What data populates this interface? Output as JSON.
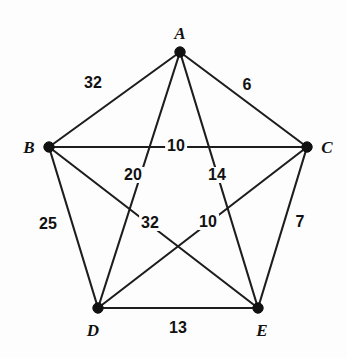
{
  "figure": {
    "background_color": "#fdfdfd",
    "line_color": "#1d1d1d",
    "text_color": "#111111"
  },
  "chart_data": {
    "type": "diagram",
    "subtype": "weighted-complete-graph",
    "title": "",
    "node_count": 5,
    "edge_count": 10,
    "nodes": [
      {
        "id": "A",
        "label": "A",
        "x": 180,
        "y": 52,
        "label_x": 180,
        "label_y": 33
      },
      {
        "id": "B",
        "label": "B",
        "x": 49,
        "y": 147,
        "label_x": 29,
        "label_y": 147
      },
      {
        "id": "C",
        "label": "C",
        "x": 307,
        "y": 147,
        "label_x": 327,
        "label_y": 147
      },
      {
        "id": "D",
        "label": "D",
        "x": 98,
        "y": 308,
        "label_x": 93,
        "label_y": 330
      },
      {
        "id": "E",
        "label": "E",
        "x": 258,
        "y": 308,
        "label_x": 262,
        "label_y": 330
      }
    ],
    "edges": [
      {
        "from": "A",
        "to": "B",
        "weight": "32",
        "label_x": 93,
        "label_y": 83
      },
      {
        "from": "A",
        "to": "C",
        "weight": "6",
        "label_x": 247,
        "label_y": 85
      },
      {
        "from": "A",
        "to": "D",
        "weight": "20",
        "label_x": 133,
        "label_y": 175
      },
      {
        "from": "A",
        "to": "E",
        "weight": "14",
        "label_x": 217,
        "label_y": 175
      },
      {
        "from": "B",
        "to": "C",
        "weight": "10",
        "label_x": 176,
        "label_y": 146
      },
      {
        "from": "B",
        "to": "D",
        "weight": "25",
        "label_x": 48,
        "label_y": 224
      },
      {
        "from": "B",
        "to": "E",
        "weight": "32",
        "label_x": 150,
        "label_y": 223
      },
      {
        "from": "C",
        "to": "D",
        "weight": "10",
        "label_x": 208,
        "label_y": 222
      },
      {
        "from": "C",
        "to": "E",
        "weight": "7",
        "label_x": 300,
        "label_y": 222
      },
      {
        "from": "D",
        "to": "E",
        "weight": "13",
        "label_x": 178,
        "label_y": 328
      }
    ]
  }
}
